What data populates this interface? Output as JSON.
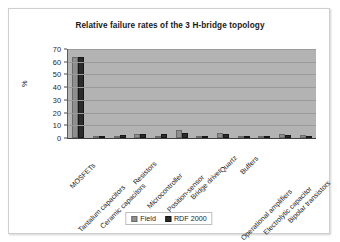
{
  "chart_data": {
    "type": "bar",
    "title": "Relative failure rates of the 3 H-bridge topology",
    "xlabel": "",
    "ylabel": "%",
    "ylim": [
      0,
      70
    ],
    "yticks": [
      0,
      10,
      20,
      30,
      40,
      50,
      60,
      70
    ],
    "grid": true,
    "legend_position": "bottom",
    "categories": [
      "MOSFETs",
      "Tantalum capacitors",
      "Ceramic capacitors",
      "Resistors",
      "Microcontroller",
      "Position-sensor",
      "Bridge driver",
      "Quartz",
      "Buffers",
      "Operational amplifiers",
      "Electrolytic capacitor",
      "Bipolar transistors"
    ],
    "series": [
      {
        "name": "Field",
        "color": "#8f8f8f",
        "values": [
          64,
          1.5,
          1,
          3.5,
          1.5,
          6,
          1,
          4,
          1,
          1.5,
          3,
          2
        ]
      },
      {
        "name": "RDF 2000",
        "color": "#2b2b2b",
        "values": [
          64,
          1,
          2.5,
          3,
          3.5,
          4,
          1,
          3.5,
          0.8,
          1.2,
          2,
          1.5
        ]
      }
    ]
  },
  "legend": {
    "entries": [
      {
        "label": "Field"
      },
      {
        "label": "RDF 2000"
      }
    ]
  }
}
